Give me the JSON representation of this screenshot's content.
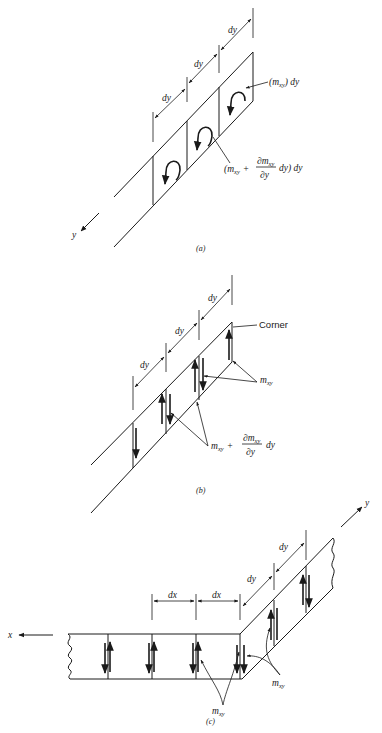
{
  "figure": {
    "panels": [
      {
        "id": "a",
        "caption": "(a)",
        "axis_label": "y",
        "dimension_labels": [
          "dy",
          "dy",
          "dy"
        ],
        "annotations": {
          "moment_top": {
            "open": "(m",
            "sub": "xy",
            "close": ") dy"
          },
          "moment_increment": {
            "prefix": "(m",
            "sub": "xy",
            "plus": "+",
            "num": "∂m",
            "num_sub": "xy",
            "den": "∂y",
            "suffix": "dy) dy"
          }
        }
      },
      {
        "id": "b",
        "caption": "(b)",
        "dimension_labels": [
          "dy",
          "dy",
          "dy"
        ],
        "annotations": {
          "corner": "Corner",
          "moment": {
            "base": "m",
            "sub": "xy"
          },
          "moment_increment": {
            "base": "m",
            "sub": "xy",
            "plus": "+",
            "num": "∂m",
            "num_sub": "xy",
            "den": "∂y",
            "suffix": "dy"
          }
        }
      },
      {
        "id": "c",
        "caption": "(c)",
        "axis_labels": {
          "x": "x",
          "y": "y"
        },
        "dimension_labels_x": [
          "dx",
          "dx"
        ],
        "dimension_labels_y": [
          "dy",
          "dy"
        ],
        "annotations": {
          "moment_bottom": {
            "base": "m",
            "sub": "xy"
          },
          "moment_right": {
            "base": "m",
            "sub": "xy"
          }
        }
      }
    ]
  }
}
